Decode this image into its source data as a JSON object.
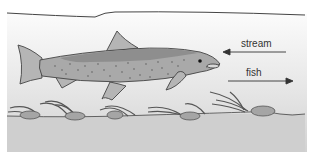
{
  "diagram": {
    "labels": {
      "stream": "stream",
      "fish": "fish"
    },
    "arrows": [
      {
        "label": "stream",
        "direction": "left"
      },
      {
        "label": "fish",
        "direction": "right"
      }
    ],
    "elements": [
      "water-surface",
      "fish",
      "riverbed",
      "aquatic-plants",
      "stones"
    ],
    "colors": {
      "water_top": "#f7f7f7",
      "water_bottom": "#d6d6d6",
      "fish_body": "#a9a9a9",
      "fish_back": "#8c8c8c",
      "fins": "#b3b3b3",
      "outline": "#444444"
    }
  }
}
